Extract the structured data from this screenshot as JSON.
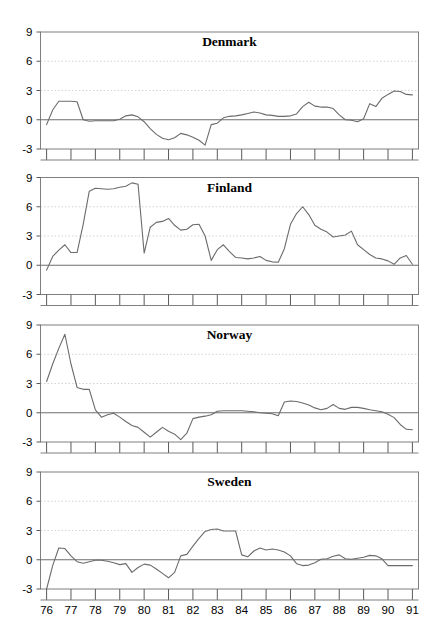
{
  "figure": {
    "width": 446,
    "height": 629,
    "background": "#ffffff",
    "line_color": "#6b6b6b",
    "grid_color": "#c8c8c8",
    "frame_color": "#7f7f7f",
    "zero_line_color": "#6e6e6e"
  },
  "chart_data": {
    "type": "line",
    "title": "",
    "xlabel": "",
    "ylabel": "",
    "ylim": [
      -3,
      9
    ],
    "yticks": [
      -3,
      0,
      3,
      6,
      9
    ],
    "ytick_labels": [
      "-3",
      "0",
      "3",
      "6",
      "9"
    ],
    "xlim": [
      1975.75,
      1991.25
    ],
    "xticks": [
      76,
      77,
      78,
      79,
      80,
      81,
      82,
      83,
      84,
      85,
      86,
      87,
      88,
      89,
      90,
      91
    ],
    "xtick_labels": [
      "76",
      "77",
      "78",
      "79",
      "80",
      "81",
      "82",
      "83",
      "84",
      "85",
      "86",
      "87",
      "88",
      "89",
      "90",
      "91"
    ],
    "grid": "horizontal-dotted-at-3-6",
    "legend": "none",
    "panels": [
      {
        "name": "Denmark",
        "title": "Denmark",
        "x": [
          1976.0,
          1976.25,
          1976.5,
          1976.75,
          1977.0,
          1977.25,
          1977.5,
          1977.75,
          1978.0,
          1978.25,
          1978.5,
          1978.75,
          1979.0,
          1979.25,
          1979.5,
          1979.75,
          1980.0,
          1980.25,
          1980.5,
          1980.75,
          1981.0,
          1981.25,
          1981.5,
          1981.75,
          1982.0,
          1982.25,
          1982.5,
          1982.75,
          1983.0,
          1983.25,
          1983.5,
          1983.75,
          1984.0,
          1984.25,
          1984.5,
          1984.75,
          1985.0,
          1985.25,
          1985.5,
          1985.75,
          1986.0,
          1986.25,
          1986.5,
          1986.75,
          1987.0,
          1987.25,
          1987.5,
          1987.75,
          1988.0,
          1988.25,
          1988.5,
          1988.75,
          1989.0,
          1989.25,
          1989.5,
          1989.75,
          1990.0,
          1990.25,
          1990.5,
          1990.75,
          1991.0
        ],
        "y": [
          -0.5,
          1.0,
          1.9,
          1.9,
          1.9,
          1.85,
          0.0,
          -0.15,
          -0.1,
          -0.1,
          -0.1,
          -0.1,
          0.05,
          0.4,
          0.5,
          0.3,
          -0.2,
          -0.9,
          -1.5,
          -1.9,
          -2.05,
          -1.85,
          -1.4,
          -1.55,
          -1.8,
          -2.1,
          -2.6,
          -0.5,
          -0.35,
          0.2,
          0.35,
          0.4,
          0.5,
          0.65,
          0.8,
          0.7,
          0.5,
          0.45,
          0.35,
          0.35,
          0.4,
          0.6,
          1.35,
          1.8,
          1.4,
          1.3,
          1.3,
          1.15,
          0.5,
          0.0,
          -0.05,
          -0.2,
          0.1,
          1.65,
          1.35,
          2.2,
          2.6,
          2.95,
          2.9,
          2.6,
          2.55
        ]
      },
      {
        "name": "Finland",
        "title": "Finland",
        "x": [
          1976.0,
          1976.25,
          1976.5,
          1976.75,
          1977.0,
          1977.25,
          1977.5,
          1977.75,
          1978.0,
          1978.25,
          1978.5,
          1978.75,
          1979.0,
          1979.25,
          1979.5,
          1979.75,
          1980.0,
          1980.25,
          1980.5,
          1980.75,
          1981.0,
          1981.25,
          1981.5,
          1981.75,
          1982.0,
          1982.25,
          1982.5,
          1982.75,
          1983.0,
          1983.25,
          1983.5,
          1983.75,
          1984.0,
          1984.25,
          1984.5,
          1984.75,
          1985.0,
          1985.25,
          1985.5,
          1985.75,
          1986.0,
          1986.25,
          1986.5,
          1986.75,
          1987.0,
          1987.25,
          1987.5,
          1987.75,
          1988.0,
          1988.25,
          1988.5,
          1988.75,
          1989.0,
          1989.25,
          1989.5,
          1989.75,
          1990.0,
          1990.25,
          1990.5,
          1990.75,
          1991.0
        ],
        "y": [
          -0.5,
          0.9,
          1.55,
          2.1,
          1.3,
          1.3,
          4.2,
          7.6,
          7.9,
          7.85,
          7.8,
          7.85,
          8.0,
          8.1,
          8.45,
          8.3,
          1.25,
          3.9,
          4.4,
          4.5,
          4.8,
          4.1,
          3.6,
          3.7,
          4.15,
          4.2,
          3.0,
          0.5,
          1.6,
          2.1,
          1.4,
          0.8,
          0.75,
          0.65,
          0.75,
          0.9,
          0.5,
          0.35,
          0.3,
          1.7,
          4.2,
          5.3,
          6.0,
          5.2,
          4.1,
          3.7,
          3.4,
          2.9,
          3.0,
          3.1,
          3.5,
          2.1,
          1.6,
          1.1,
          0.75,
          0.65,
          0.45,
          0.1,
          0.75,
          1.0,
          0.1
        ]
      },
      {
        "name": "Norway",
        "title": "Norway",
        "x": [
          1976.0,
          1976.25,
          1976.5,
          1976.75,
          1977.0,
          1977.25,
          1977.5,
          1977.75,
          1978.0,
          1978.25,
          1978.5,
          1978.75,
          1979.0,
          1979.25,
          1979.5,
          1979.75,
          1980.0,
          1980.25,
          1980.5,
          1980.75,
          1981.0,
          1981.25,
          1981.5,
          1981.75,
          1982.0,
          1982.25,
          1982.5,
          1982.75,
          1983.0,
          1983.25,
          1983.5,
          1983.75,
          1984.0,
          1984.25,
          1984.5,
          1984.75,
          1985.0,
          1985.25,
          1985.5,
          1985.75,
          1986.0,
          1986.25,
          1986.5,
          1986.75,
          1987.0,
          1987.25,
          1987.5,
          1987.75,
          1988.0,
          1988.25,
          1988.5,
          1988.75,
          1989.0,
          1989.25,
          1989.5,
          1989.75,
          1990.0,
          1990.25,
          1990.5,
          1990.75,
          1991.0
        ],
        "y": [
          3.2,
          5.0,
          6.6,
          8.05,
          5.0,
          2.6,
          2.4,
          2.4,
          0.3,
          -0.45,
          -0.2,
          -0.05,
          -0.45,
          -0.9,
          -1.3,
          -1.5,
          -2.0,
          -2.5,
          -2.0,
          -1.5,
          -1.9,
          -2.2,
          -2.75,
          -2.1,
          -0.6,
          -0.45,
          -0.35,
          -0.2,
          0.15,
          0.2,
          0.2,
          0.2,
          0.2,
          0.15,
          0.1,
          0.0,
          -0.05,
          -0.1,
          -0.3,
          1.1,
          1.2,
          1.15,
          1.0,
          0.8,
          0.5,
          0.3,
          0.45,
          0.85,
          0.45,
          0.35,
          0.55,
          0.55,
          0.45,
          0.3,
          0.2,
          0.1,
          -0.15,
          -0.5,
          -1.2,
          -1.7,
          -1.75
        ]
      },
      {
        "name": "Sweden",
        "title": "Sweden",
        "x": [
          1976.0,
          1976.25,
          1976.5,
          1976.75,
          1977.0,
          1977.25,
          1977.5,
          1977.75,
          1978.0,
          1978.25,
          1978.5,
          1978.75,
          1979.0,
          1979.25,
          1979.5,
          1979.75,
          1980.0,
          1980.25,
          1980.5,
          1980.75,
          1981.0,
          1981.25,
          1981.5,
          1981.75,
          1982.0,
          1982.25,
          1982.5,
          1982.75,
          1983.0,
          1983.25,
          1983.5,
          1983.75,
          1984.0,
          1984.25,
          1984.5,
          1984.75,
          1985.0,
          1985.25,
          1985.5,
          1985.75,
          1986.0,
          1986.25,
          1986.5,
          1986.75,
          1987.0,
          1987.25,
          1987.5,
          1987.75,
          1988.0,
          1988.25,
          1988.5,
          1988.75,
          1989.0,
          1989.25,
          1989.5,
          1989.75,
          1990.0,
          1990.25,
          1990.5,
          1990.75,
          1991.0
        ],
        "y": [
          -3.0,
          -0.6,
          1.2,
          1.15,
          0.4,
          -0.2,
          -0.35,
          -0.2,
          -0.05,
          -0.05,
          -0.15,
          -0.3,
          -0.5,
          -0.4,
          -1.3,
          -0.8,
          -0.45,
          -0.55,
          -0.95,
          -1.4,
          -1.85,
          -1.3,
          0.4,
          0.55,
          1.4,
          2.2,
          2.9,
          3.1,
          3.15,
          2.95,
          2.95,
          2.95,
          0.5,
          0.3,
          0.9,
          1.2,
          1.0,
          1.1,
          1.0,
          0.8,
          0.4,
          -0.4,
          -0.6,
          -0.55,
          -0.3,
          0.05,
          0.1,
          0.35,
          0.5,
          0.1,
          0.05,
          0.15,
          0.25,
          0.45,
          0.4,
          0.1,
          -0.6,
          -0.6,
          -0.6,
          -0.6,
          -0.6
        ]
      }
    ]
  }
}
